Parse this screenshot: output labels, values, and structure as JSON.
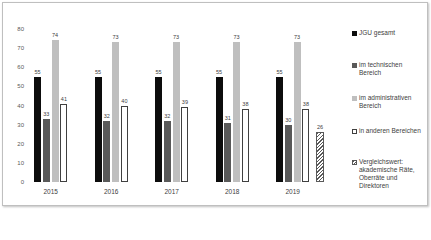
{
  "chart_data": {
    "type": "bar",
    "title": "",
    "xlabel": "",
    "ylabel": "",
    "ylim": [
      0,
      80
    ],
    "yticks": [
      0,
      10,
      20,
      30,
      40,
      50,
      60,
      70,
      80
    ],
    "grid": false,
    "legend_position": "right",
    "categories": [
      "2015",
      "2016",
      "2017",
      "2018",
      "2019"
    ],
    "series": [
      {
        "name": "JGU gesamt",
        "color": "#0d0d0d",
        "values": [
          55,
          55,
          55,
          55,
          55
        ]
      },
      {
        "name": "im technischen Bereich",
        "color": "#595959",
        "values": [
          33,
          32,
          32,
          31,
          30
        ]
      },
      {
        "name": "im administrativen Bereich",
        "color": "#bfbfbf",
        "values": [
          74,
          73,
          73,
          73,
          73
        ]
      },
      {
        "name": "in anderen Bereichen",
        "color": "#ffffff",
        "values": [
          41,
          40,
          39,
          38,
          38
        ]
      }
    ],
    "reference": {
      "name": "Vergleichswert: akademische Räte, Oberräte und Direktoren",
      "value": 26,
      "pattern": "hatched",
      "position_after": "2019"
    }
  },
  "axis": {
    "yticks": [
      "0",
      "10",
      "20",
      "30",
      "40",
      "50",
      "60",
      "70",
      "80"
    ]
  },
  "groups": [
    {
      "year": "2015",
      "labels": [
        "55",
        "33",
        "74",
        "41"
      ]
    },
    {
      "year": "2016",
      "labels": [
        "55",
        "32",
        "73",
        "40"
      ]
    },
    {
      "year": "2017",
      "labels": [
        "55",
        "32",
        "73",
        "39"
      ]
    },
    {
      "year": "2018",
      "labels": [
        "55",
        "31",
        "73",
        "38"
      ]
    },
    {
      "year": "2019",
      "labels": [
        "55",
        "30",
        "73",
        "38"
      ]
    }
  ],
  "reference_label": "26",
  "legend": [
    {
      "label": "JGU gesamt"
    },
    {
      "label": "im technischen Bereich"
    },
    {
      "label": "im administrativen Bereich"
    },
    {
      "label": "in anderen Bereichen"
    },
    {
      "label": "Vergleichswert: akademische Räte, Oberräte und Direktoren"
    }
  ]
}
